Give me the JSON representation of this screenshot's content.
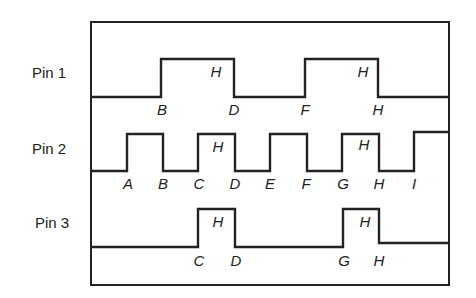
{
  "diagram": {
    "type": "timing-diagram",
    "colors": {
      "line": "#222222",
      "background": "#ffffff"
    },
    "pins": [
      {
        "label": "Pin 1",
        "waveform": "low-high-low-high-low",
        "high_label": "H",
        "edge_labels": [
          "B",
          "D",
          "F",
          "H"
        ],
        "high_marks": [
          "H",
          "H"
        ]
      },
      {
        "label": "Pin 2",
        "waveform": "low-high-low-high-low-high-low-high-low-high",
        "high_label": "H",
        "edge_labels": [
          "A",
          "B",
          "C",
          "D",
          "E",
          "F",
          "G",
          "H",
          "I"
        ],
        "high_marks": [
          "H",
          "H"
        ]
      },
      {
        "label": "Pin 3",
        "waveform": "low-high-low-high-low",
        "high_label": "H",
        "edge_labels": [
          "C",
          "D",
          "G",
          "H"
        ],
        "high_marks": [
          "H",
          "H"
        ]
      }
    ]
  }
}
